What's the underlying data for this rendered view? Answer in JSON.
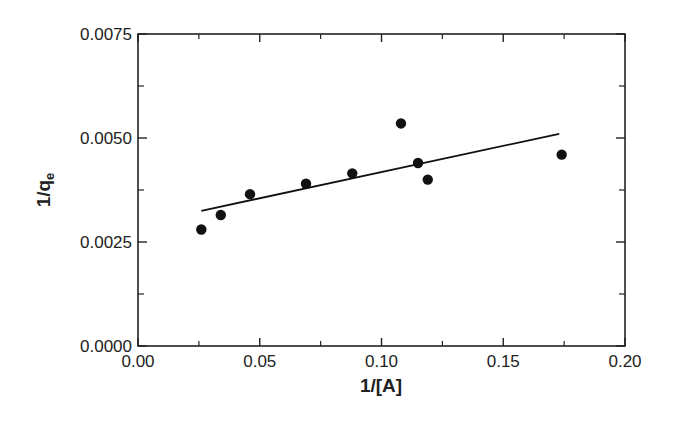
{
  "chart_data": {
    "type": "scatter",
    "title": "",
    "xlabel": "1/[A]",
    "ylabel": "1/q",
    "ylabel_subscript": "e",
    "xlim": [
      0.0,
      0.2
    ],
    "ylim": [
      0.0,
      0.0075
    ],
    "x_ticks": [
      "0.00",
      "0.05",
      "0.10",
      "0.15",
      "0.20"
    ],
    "y_ticks": [
      "0.0000",
      "0.0025",
      "0.0050",
      "0.0075"
    ],
    "grid": false,
    "legend": null,
    "series": [
      {
        "name": "data",
        "type": "scatter",
        "points": [
          {
            "x": 0.026,
            "y": 0.0028
          },
          {
            "x": 0.034,
            "y": 0.00315
          },
          {
            "x": 0.046,
            "y": 0.00365
          },
          {
            "x": 0.069,
            "y": 0.0039
          },
          {
            "x": 0.088,
            "y": 0.00415
          },
          {
            "x": 0.108,
            "y": 0.00535
          },
          {
            "x": 0.115,
            "y": 0.0044
          },
          {
            "x": 0.119,
            "y": 0.004
          },
          {
            "x": 0.174,
            "y": 0.0046
          }
        ]
      },
      {
        "name": "linear fit",
        "type": "line",
        "points": [
          {
            "x": 0.026,
            "y": 0.00325
          },
          {
            "x": 0.173,
            "y": 0.0051
          }
        ]
      }
    ]
  }
}
